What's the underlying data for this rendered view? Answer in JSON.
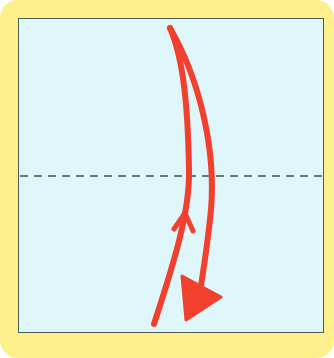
{
  "diagram": {
    "type": "origami-fold-step",
    "colors": {
      "frame": "#fdf08a",
      "paper": "#dff6fb",
      "paper_border": "#4a5a5a",
      "fold_line": "#3f5257",
      "arrow": "#f2402f"
    },
    "fold_line": {
      "style": "dashed",
      "orientation": "horizontal",
      "label": "valley fold"
    },
    "arrows": [
      {
        "name": "fold-down-arrow",
        "direction": "down",
        "head": "filled-triangle"
      },
      {
        "name": "unfold-up-arrow",
        "direction": "up",
        "head": "open-chevron"
      }
    ],
    "icons": [
      "fold-arrow-icon",
      "return-arrow-icon"
    ]
  }
}
